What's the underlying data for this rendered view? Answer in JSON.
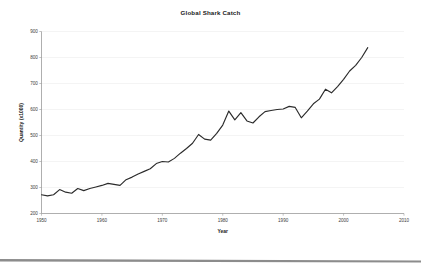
{
  "chart_data": {
    "type": "line",
    "title": "Global Shark Catch",
    "xlabel": "Year",
    "ylabel": "Quantity (x1000)",
    "xlim": [
      1950,
      2010
    ],
    "ylim": [
      200,
      900
    ],
    "xticks": [
      1950,
      1960,
      1970,
      1980,
      1990,
      2000,
      2010
    ],
    "yticks": [
      200,
      300,
      400,
      500,
      600,
      700,
      800,
      900
    ],
    "grid": true,
    "legend": "none",
    "series": [
      {
        "name": "Global shark catch",
        "color": "#2b2b2b",
        "x": [
          1950,
          1951,
          1952,
          1953,
          1954,
          1955,
          1956,
          1957,
          1958,
          1959,
          1960,
          1961,
          1962,
          1963,
          1964,
          1965,
          1966,
          1967,
          1968,
          1969,
          1970,
          1971,
          1972,
          1973,
          1974,
          1975,
          1976,
          1977,
          1978,
          1979,
          1980,
          1981,
          1982,
          1983,
          1984,
          1985,
          1986,
          1987,
          1988,
          1989,
          1990,
          1991,
          1992,
          1993,
          1994,
          1995,
          1996,
          1997,
          1998,
          1999,
          2000,
          2001,
          2002,
          2003,
          2004
        ],
        "values": [
          272,
          268,
          272,
          292,
          282,
          278,
          296,
          288,
          296,
          302,
          308,
          316,
          312,
          308,
          330,
          340,
          352,
          362,
          372,
          392,
          400,
          398,
          412,
          432,
          450,
          470,
          504,
          486,
          482,
          508,
          540,
          594,
          560,
          588,
          556,
          548,
          572,
          592,
          596,
          600,
          602,
          612,
          608,
          568,
          594,
          622,
          640,
          678,
          664,
          688,
          716,
          748,
          770,
          800,
          838
        ]
      }
    ]
  },
  "ylabel_display": "Quantity (x1000)",
  "colors": {
    "line": "#2b2b2b",
    "axis": "#9a9a9a",
    "grid": "#e8e8e8",
    "divider": "#8c8c8c",
    "text": "#1a1a1a"
  }
}
